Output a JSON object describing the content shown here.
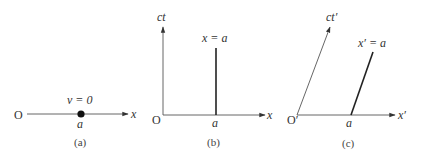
{
  "colors": {
    "axis": "#555555",
    "worldline": "#222222",
    "text": "#333333",
    "particle": "#111111"
  },
  "panels": [
    {
      "id": "a",
      "caption": "(a)",
      "origin_label": "O",
      "x_axis_label": "x",
      "point_label": "a",
      "velocity_label": "v = 0"
    },
    {
      "id": "b",
      "caption": "(b)",
      "origin_label": "O",
      "x_axis_label": "x",
      "t_axis_label": "ct",
      "point_label": "a",
      "worldline_label": "x = a"
    },
    {
      "id": "c",
      "caption": "(c)",
      "origin_label": "O′",
      "x_axis_label": "x′",
      "t_axis_label": "ct′",
      "point_label": "a",
      "worldline_label": "x′ = a"
    }
  ]
}
